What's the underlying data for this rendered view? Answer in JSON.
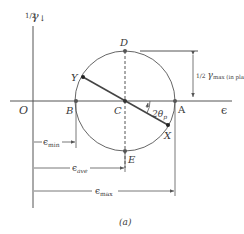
{
  "figure": {
    "caption": "(a)",
    "axes": {
      "vertical_label": {
        "fraction": "1/2",
        "symbol": "γ",
        "arrow": "↓"
      },
      "horizontal_label": "ϵ",
      "origin_label": "O"
    },
    "points": {
      "A": "A",
      "B": "B",
      "C": "C",
      "D": "D",
      "E": "E",
      "X": "X",
      "Y": "Y"
    },
    "angle_label": {
      "prefix": "2θ",
      "subscript": "p"
    },
    "radius_label": {
      "fraction": "1/2",
      "symbol": "γ",
      "subscript": "max (in plane)"
    },
    "dimensions": {
      "min": {
        "symbol": "ϵ",
        "subscript": "min"
      },
      "ave": {
        "symbol": "ϵ",
        "subscript": "ave"
      },
      "max": {
        "symbol": "ϵ",
        "subscript": "max"
      }
    },
    "colors": {
      "line": "#555555",
      "point": "#333333",
      "text": "#3a3a3a"
    }
  }
}
